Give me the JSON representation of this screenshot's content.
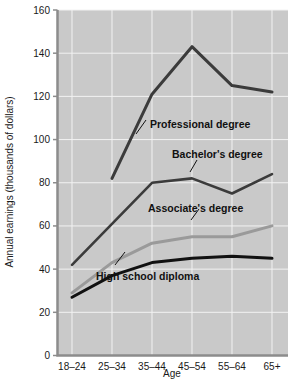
{
  "chart_data": {
    "type": "line",
    "title": "",
    "xlabel": "Age",
    "ylabel": "Annual earnings (thousands of dollars)",
    "categories": [
      "18–24",
      "25–34",
      "35–44",
      "45–54",
      "55–64",
      "65+"
    ],
    "ylim": [
      0,
      160
    ],
    "yticks": [
      0,
      20,
      40,
      60,
      80,
      100,
      120,
      140,
      160
    ],
    "ytick_labels": [
      "0",
      "20",
      "40",
      "60",
      "80",
      "100",
      "120",
      "140",
      "160"
    ],
    "grid": true,
    "legend": "inline-annotations",
    "plot_background": "#c9c9c9",
    "gridline_color": "#f2f2f2",
    "series": [
      {
        "name": "Professional degree",
        "color": "#3b3b3b",
        "width": 3,
        "x": [
          "25–34",
          "35–44",
          "45–54",
          "55–64",
          "65+"
        ],
        "values": [
          82,
          121,
          143,
          125,
          122
        ]
      },
      {
        "name": "Bachelor's degree",
        "color": "#3b3b3b",
        "width": 2.6,
        "x": [
          "18–24",
          "25–34",
          "35–44",
          "45–54",
          "55–64",
          "65+"
        ],
        "values": [
          42,
          61,
          80,
          82,
          75,
          84
        ]
      },
      {
        "name": "Associate's degree",
        "color": "#9a9a9a",
        "width": 3,
        "x": [
          "18–24",
          "25–34",
          "35–44",
          "45–54",
          "55–64",
          "65+"
        ],
        "values": [
          29,
          43,
          52,
          55,
          55,
          60
        ]
      },
      {
        "name": "High school diploma",
        "color": "#111111",
        "width": 3,
        "x": [
          "18–24",
          "25–34",
          "35–44",
          "45–54",
          "55–64",
          "65+"
        ],
        "values": [
          27,
          37,
          43,
          45,
          46,
          45
        ]
      }
    ],
    "annotations": [
      {
        "label": "Professional degree",
        "series": "Professional degree"
      },
      {
        "label": "Bachelor's degree",
        "series": "Bachelor's degree"
      },
      {
        "label": "Associate's degree",
        "series": "Associate's degree"
      },
      {
        "label": "High school diploma",
        "series": "High school diploma"
      }
    ]
  },
  "axis": {
    "y_title": "Annual earnings (thousands of dollars)",
    "x_title": "Age",
    "y_labels": [
      "160",
      "140",
      "120",
      "100",
      "80",
      "60",
      "40",
      "20",
      "0"
    ],
    "x_labels": [
      "18–24",
      "25–34",
      "35–44",
      "45–54",
      "55–64",
      "65+"
    ]
  },
  "labels": {
    "professional": "Professional degree",
    "bachelors": "Bachelor's degree",
    "associates": "Associate's degree",
    "highschool": "High school diploma"
  }
}
